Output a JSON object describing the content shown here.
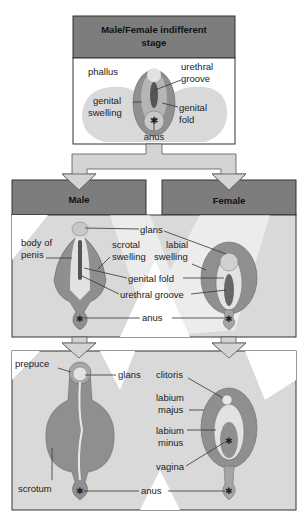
{
  "colors": {
    "header_fill": "#7d7d7d",
    "panel_bg": "#d9d9d9",
    "arrow_fill": "#d4d4d4",
    "organ_outer": "#8f8f8f",
    "organ_mid": "#b5b5b5",
    "organ_light": "#e2e2e2",
    "groove": "#555555"
  },
  "top": {
    "title_line1": "Male/Female indifferent",
    "title_line2": "stage",
    "labels": {
      "phallus": "phallus",
      "urethral_groove_1": "urethral",
      "urethral_groove_2": "groove",
      "genital_swelling_1": "genital",
      "genital_swelling_2": "swelling",
      "genital_fold_1": "genital",
      "genital_fold_2": "fold",
      "anus": "anus"
    }
  },
  "middle": {
    "male_header": "Male",
    "female_header": "Female",
    "labels": {
      "glans": "glans",
      "body_of_penis_1": "body of",
      "body_of_penis_2": "penis",
      "scrotal_swelling_1": "scrotal",
      "scrotal_swelling_2": "swelling",
      "labial_swelling_1": "labial",
      "labial_swelling_2": "swelling",
      "genital_fold": "genital fold",
      "urethral_groove": "urethral groove",
      "anus": "anus"
    }
  },
  "bottom": {
    "labels": {
      "prepuce": "prepuce",
      "glans": "glans",
      "scrotum": "scrotum",
      "clitoris": "clitoris",
      "labium_majus_1": "labium",
      "labium_majus_2": "majus",
      "labium_minus_1": "labium",
      "labium_minus_2": "minus",
      "vagina": "vagina",
      "anus": "anus"
    }
  }
}
